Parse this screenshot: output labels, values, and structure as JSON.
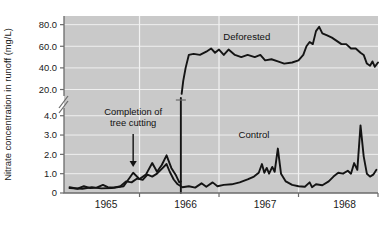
{
  "chart_data": {
    "type": "line",
    "title": "",
    "xlabel": "",
    "ylabel": "Nitrate concentration in runoff (mg/L)",
    "grid": true,
    "legend_position": "inline-labels",
    "x_tick_labels": [
      "1965",
      "1966",
      "1967",
      "1968"
    ],
    "y_axis_note": "broken y-axis: lower panel 0-4.0 mg/L, upper panel 20.0-80.0 mg/L",
    "y_tick_labels_lower": [
      "0",
      "1.0",
      "2.0",
      "3.0",
      "4.0"
    ],
    "y_tick_labels_upper": [
      "20.0",
      "40.0",
      "60.0",
      "80.0"
    ],
    "ylim_lower": [
      0,
      4.4
    ],
    "ylim_upper": [
      14,
      88
    ],
    "xlim": [
      1964.55,
      1968.5
    ],
    "annotations": [
      {
        "name": "completion-of-tree-cutting",
        "line1": "Completion of",
        "line2": "tree cutting",
        "x": 1965.42,
        "points_to_y": 1.35
      }
    ],
    "series": [
      {
        "name": "Deforested",
        "label": "Deforested",
        "label_x": 1966.85,
        "label_y": 66,
        "color": "#141414",
        "panel": "both",
        "points_lower": [
          [
            1964.62,
            0.25
          ],
          [
            1964.78,
            0.22
          ],
          [
            1964.9,
            0.3
          ],
          [
            1965.02,
            0.24
          ],
          [
            1965.15,
            0.26
          ],
          [
            1965.3,
            0.35
          ],
          [
            1965.42,
            1.05
          ],
          [
            1965.5,
            0.72
          ],
          [
            1965.58,
            0.95
          ],
          [
            1965.66,
            1.55
          ],
          [
            1965.72,
            1.1
          ],
          [
            1965.78,
            1.45
          ],
          [
            1965.84,
            1.95
          ],
          [
            1965.9,
            1.3
          ],
          [
            1965.96,
            0.9
          ],
          [
            1966.0,
            0.55
          ],
          [
            1966.02,
            0.6
          ]
        ],
        "points_upper": [
          [
            1966.03,
            16
          ],
          [
            1966.05,
            28
          ],
          [
            1966.08,
            40
          ],
          [
            1966.12,
            52
          ],
          [
            1966.18,
            53
          ],
          [
            1966.26,
            52
          ],
          [
            1966.34,
            55
          ],
          [
            1966.4,
            58
          ],
          [
            1966.45,
            54
          ],
          [
            1966.5,
            57
          ],
          [
            1966.56,
            52
          ],
          [
            1966.62,
            57
          ],
          [
            1966.7,
            52
          ],
          [
            1966.78,
            50
          ],
          [
            1966.86,
            52
          ],
          [
            1966.95,
            50
          ],
          [
            1967.02,
            52
          ],
          [
            1967.08,
            47
          ],
          [
            1967.16,
            48
          ],
          [
            1967.24,
            46
          ],
          [
            1967.32,
            44
          ],
          [
            1967.42,
            45
          ],
          [
            1967.5,
            47
          ],
          [
            1967.56,
            52
          ],
          [
            1967.6,
            60
          ],
          [
            1967.64,
            64
          ],
          [
            1967.68,
            62
          ],
          [
            1967.72,
            74
          ],
          [
            1967.76,
            78
          ],
          [
            1967.8,
            72
          ],
          [
            1967.86,
            70
          ],
          [
            1967.92,
            68
          ],
          [
            1967.98,
            65
          ],
          [
            1968.04,
            62
          ],
          [
            1968.1,
            62
          ],
          [
            1968.16,
            58
          ],
          [
            1968.22,
            58
          ],
          [
            1968.28,
            54
          ],
          [
            1968.32,
            52
          ],
          [
            1968.36,
            44
          ],
          [
            1968.4,
            42
          ],
          [
            1968.43,
            46
          ],
          [
            1968.46,
            41
          ],
          [
            1968.5,
            45
          ]
        ],
        "break_crossing_x": 1966.02
      },
      {
        "name": "Control",
        "label": "Control",
        "label_x": 1966.94,
        "label_y": 2.85,
        "color": "#141414",
        "panel": "lower",
        "points_lower": [
          [
            1964.62,
            0.3
          ],
          [
            1964.72,
            0.22
          ],
          [
            1964.8,
            0.35
          ],
          [
            1964.88,
            0.25
          ],
          [
            1964.96,
            0.28
          ],
          [
            1965.04,
            0.42
          ],
          [
            1965.1,
            0.3
          ],
          [
            1965.18,
            0.28
          ],
          [
            1965.26,
            0.35
          ],
          [
            1965.33,
            0.6
          ],
          [
            1965.4,
            0.55
          ],
          [
            1965.47,
            0.75
          ],
          [
            1965.54,
            0.68
          ],
          [
            1965.6,
            0.95
          ],
          [
            1965.66,
            0.85
          ],
          [
            1965.72,
            1.0
          ],
          [
            1965.78,
            1.25
          ],
          [
            1965.84,
            1.5
          ],
          [
            1965.88,
            1.1
          ],
          [
            1965.93,
            0.7
          ],
          [
            1965.98,
            0.45
          ],
          [
            1966.04,
            0.3
          ],
          [
            1966.12,
            0.35
          ],
          [
            1966.2,
            0.28
          ],
          [
            1966.28,
            0.5
          ],
          [
            1966.34,
            0.32
          ],
          [
            1966.42,
            0.55
          ],
          [
            1966.48,
            0.35
          ],
          [
            1966.56,
            0.42
          ],
          [
            1966.66,
            0.45
          ],
          [
            1966.76,
            0.55
          ],
          [
            1966.86,
            0.7
          ],
          [
            1966.94,
            0.85
          ],
          [
            1967.0,
            1.05
          ],
          [
            1967.04,
            1.5
          ],
          [
            1967.07,
            1.05
          ],
          [
            1967.1,
            1.3
          ],
          [
            1967.13,
            1.0
          ],
          [
            1967.17,
            1.35
          ],
          [
            1967.2,
            1.1
          ],
          [
            1967.24,
            2.3
          ],
          [
            1967.28,
            1.0
          ],
          [
            1967.34,
            0.6
          ],
          [
            1967.42,
            0.42
          ],
          [
            1967.5,
            0.35
          ],
          [
            1967.58,
            0.32
          ],
          [
            1967.64,
            0.55
          ],
          [
            1967.67,
            0.3
          ],
          [
            1967.72,
            0.45
          ],
          [
            1967.8,
            0.4
          ],
          [
            1967.88,
            0.6
          ],
          [
            1967.94,
            0.85
          ],
          [
            1968.0,
            1.05
          ],
          [
            1968.06,
            1.0
          ],
          [
            1968.12,
            1.15
          ],
          [
            1968.16,
            1.0
          ],
          [
            1968.2,
            1.55
          ],
          [
            1968.24,
            1.2
          ],
          [
            1968.28,
            3.5
          ],
          [
            1968.32,
            1.9
          ],
          [
            1968.36,
            1.0
          ],
          [
            1968.4,
            0.85
          ],
          [
            1968.44,
            0.95
          ],
          [
            1968.48,
            1.2
          ]
        ]
      }
    ]
  }
}
